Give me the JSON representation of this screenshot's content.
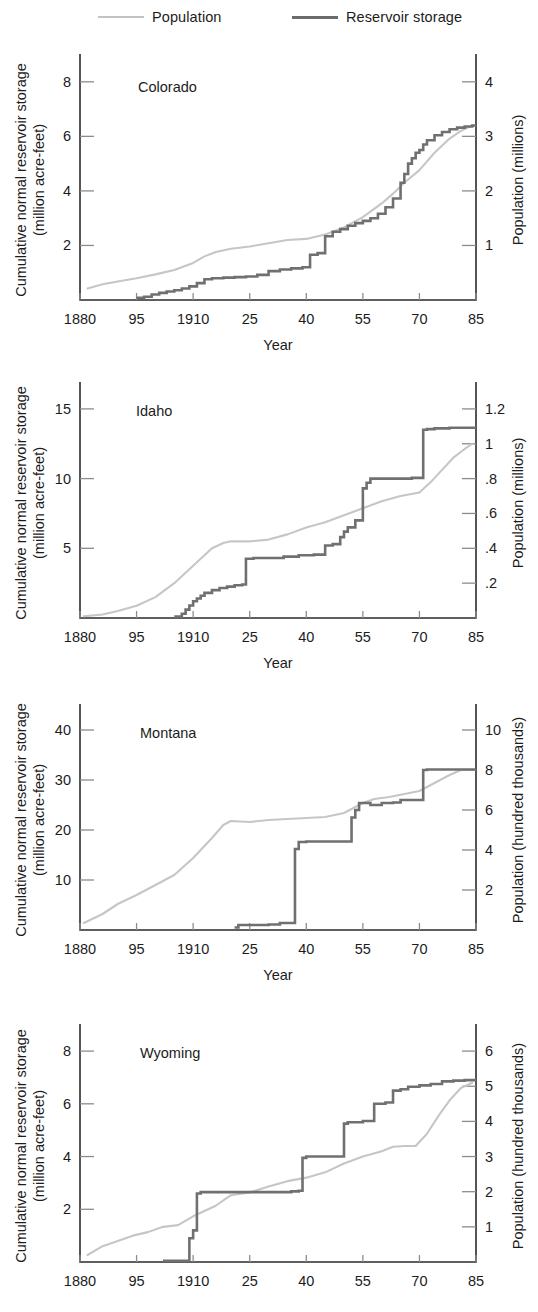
{
  "legend": {
    "items": [
      {
        "label": "Population",
        "color": "#c6c6c6",
        "style": "light-line"
      },
      {
        "label": "Reservoir storage",
        "color": "#707070",
        "style": "dark-line"
      }
    ]
  },
  "common": {
    "xlabel": "Year",
    "ylabel_left": "Cumulative normal reservoir storage",
    "ylabel_left_2": "(million acre-feet)",
    "x_tick_labels": [
      "1880",
      "95",
      "1910",
      "25",
      "40",
      "55",
      "70",
      "85"
    ],
    "x_tick_values": [
      1880,
      1895,
      1910,
      1925,
      1940,
      1955,
      1970,
      1985
    ],
    "xlim": [
      1880,
      1985
    ]
  },
  "chart_data": [
    {
      "type": "line",
      "title": "Colorado",
      "xlabel": "Year",
      "ylabel": "Cumulative normal reservoir storage (million acre-feet)",
      "ylabel_right": "Population (millions)",
      "xlim": [
        1880,
        1985
      ],
      "ylim": [
        0,
        8.8
      ],
      "ylim_right": [
        0,
        4.4
      ],
      "grid": false,
      "legend_position": "top",
      "yticks": [
        2,
        4,
        6,
        8
      ],
      "ytick_labels": [
        "2",
        "4",
        "6",
        "8"
      ],
      "yticks_right": [
        1,
        2,
        3,
        4
      ],
      "ytick_labels_right": [
        "1",
        "2",
        "3",
        "4"
      ],
      "series": [
        {
          "name": "Population",
          "axis": "right",
          "x": [
            1882,
            1886,
            1890,
            1895,
            1900,
            1905,
            1910,
            1913,
            1916,
            1920,
            1925,
            1930,
            1935,
            1940,
            1945,
            1950,
            1955,
            1960,
            1963,
            1966,
            1970,
            1974,
            1978,
            1981,
            1984
          ],
          "y": [
            0.21,
            0.29,
            0.34,
            0.4,
            0.47,
            0.55,
            0.68,
            0.8,
            0.88,
            0.94,
            0.98,
            1.04,
            1.1,
            1.12,
            1.2,
            1.33,
            1.52,
            1.77,
            1.95,
            2.15,
            2.38,
            2.7,
            2.96,
            3.1,
            3.2
          ]
        },
        {
          "name": "Reservoir storage",
          "axis": "left",
          "step": true,
          "x": [
            1895,
            1897,
            1899,
            1901,
            1903,
            1905,
            1907,
            1909,
            1911,
            1913,
            1915,
            1918,
            1921,
            1924,
            1927,
            1930,
            1933,
            1936,
            1939,
            1941,
            1943,
            1945,
            1947,
            1949,
            1951,
            1953,
            1955,
            1957,
            1959,
            1961,
            1963,
            1965,
            1966,
            1967,
            1968,
            1969,
            1970,
            1971,
            1972,
            1974,
            1976,
            1978,
            1980,
            1982,
            1984
          ],
          "y": [
            0.08,
            0.12,
            0.2,
            0.26,
            0.31,
            0.36,
            0.42,
            0.5,
            0.62,
            0.76,
            0.8,
            0.82,
            0.84,
            0.86,
            0.92,
            1.06,
            1.12,
            1.16,
            1.2,
            1.66,
            1.72,
            2.34,
            2.5,
            2.6,
            2.72,
            2.82,
            2.9,
            3.0,
            3.16,
            3.4,
            3.72,
            4.3,
            4.62,
            5.0,
            5.2,
            5.4,
            5.5,
            5.7,
            5.86,
            6.04,
            6.16,
            6.26,
            6.32,
            6.36,
            6.4
          ]
        }
      ]
    },
    {
      "type": "line",
      "title": "Idaho",
      "xlabel": "Year",
      "ylabel": "Cumulative normal reservoir storage (million acre-feet)",
      "ylabel_right": "Population (millions)",
      "xlim": [
        1880,
        1985
      ],
      "ylim": [
        0,
        16.5
      ],
      "ylim_right": [
        0,
        1.32
      ],
      "grid": false,
      "legend_position": "top",
      "yticks": [
        5,
        10,
        15
      ],
      "ytick_labels": [
        "5",
        "10",
        "15"
      ],
      "yticks_right": [
        0.2,
        0.4,
        0.6,
        0.8,
        1.0,
        1.2
      ],
      "ytick_labels_right": [
        ".2",
        ".4",
        ".6",
        ".8",
        "1",
        "1.2"
      ],
      "series": [
        {
          "name": "Population",
          "axis": "right",
          "x": [
            1881,
            1886,
            1890,
            1895,
            1900,
            1905,
            1910,
            1915,
            1918,
            1920,
            1925,
            1930,
            1935,
            1940,
            1945,
            1950,
            1955,
            1960,
            1965,
            1970,
            1973,
            1976,
            1979,
            1982,
            1984
          ],
          "y": [
            0.01,
            0.02,
            0.04,
            0.07,
            0.12,
            0.2,
            0.3,
            0.4,
            0.43,
            0.44,
            0.44,
            0.45,
            0.48,
            0.52,
            0.55,
            0.59,
            0.63,
            0.67,
            0.7,
            0.72,
            0.78,
            0.85,
            0.92,
            0.97,
            1.0
          ]
        },
        {
          "name": "Reservoir storage",
          "axis": "left",
          "step": true,
          "x": [
            1905,
            1907,
            1908,
            1909,
            1910,
            1911,
            1912,
            1913,
            1915,
            1917,
            1919,
            1921,
            1923,
            1924,
            1926,
            1930,
            1934,
            1938,
            1942,
            1945,
            1947,
            1949,
            1950,
            1951,
            1953,
            1955,
            1956,
            1957,
            1960,
            1964,
            1968,
            1971,
            1972,
            1974,
            1978,
            1982,
            1984
          ],
          "y": [
            0.1,
            0.3,
            0.6,
            0.9,
            1.2,
            1.4,
            1.6,
            1.8,
            2.0,
            2.15,
            2.25,
            2.35,
            2.4,
            4.25,
            4.3,
            4.3,
            4.4,
            4.5,
            4.55,
            5.2,
            5.3,
            5.8,
            6.2,
            6.5,
            7.0,
            9.3,
            9.7,
            10.0,
            10.0,
            10.0,
            10.05,
            13.5,
            13.55,
            13.6,
            13.65,
            13.65,
            13.65
          ]
        }
      ]
    },
    {
      "type": "line",
      "title": "Montana",
      "xlabel": "Year",
      "ylabel": "Cumulative normal reservoir storage (million acre-feet)",
      "ylabel_right": "Population (hundred thousands)",
      "xlim": [
        1880,
        1985
      ],
      "ylim": [
        0,
        44
      ],
      "ylim_right": [
        0,
        11
      ],
      "grid": false,
      "legend_position": "top",
      "yticks": [
        10,
        20,
        30,
        40
      ],
      "ytick_labels": [
        "10",
        "20",
        "30",
        "40"
      ],
      "yticks_right": [
        2,
        4,
        6,
        8,
        10
      ],
      "ytick_labels_right": [
        "2",
        "4",
        "6",
        "8",
        "10"
      ],
      "series": [
        {
          "name": "Population",
          "axis": "right",
          "x": [
            1881,
            1886,
            1890,
            1895,
            1900,
            1905,
            1910,
            1915,
            1918,
            1920,
            1925,
            1930,
            1935,
            1940,
            1945,
            1950,
            1955,
            1958,
            1962,
            1966,
            1970,
            1974,
            1978,
            1981,
            1984
          ],
          "y": [
            0.35,
            0.8,
            1.3,
            1.75,
            2.25,
            2.75,
            3.6,
            4.6,
            5.25,
            5.45,
            5.4,
            5.5,
            5.55,
            5.6,
            5.65,
            5.85,
            6.35,
            6.55,
            6.65,
            6.8,
            6.95,
            7.35,
            7.75,
            8.0,
            8.0
          ]
        },
        {
          "name": "Reservoir storage",
          "axis": "left",
          "step": true,
          "x": [
            1921,
            1922,
            1926,
            1930,
            1933,
            1936,
            1937,
            1938,
            1940,
            1943,
            1946,
            1950,
            1952,
            1953,
            1954,
            1955,
            1957,
            1960,
            1963,
            1965,
            1968,
            1971,
            1972,
            1975,
            1978,
            1981,
            1984
          ],
          "y": [
            0.5,
            1.0,
            1.0,
            1.1,
            1.4,
            1.4,
            16.2,
            17.6,
            17.7,
            17.7,
            17.7,
            17.7,
            22.5,
            24.0,
            25.4,
            25.4,
            25.0,
            25.4,
            25.5,
            26.0,
            26.0,
            32.0,
            32.1,
            32.1,
            32.1,
            32.1,
            32.1
          ]
        }
      ]
    },
    {
      "type": "line",
      "title": "Wyoming",
      "xlabel": "Year",
      "ylabel": "Cumulative normal reservoir storage (million acre-feet)",
      "ylabel_right": "Population (hundred thousands)",
      "xlim": [
        1880,
        1985
      ],
      "ylim": [
        0,
        8.8
      ],
      "ylim_right": [
        0,
        6.6
      ],
      "grid": false,
      "legend_position": "top",
      "yticks": [
        2,
        4,
        6,
        8
      ],
      "ytick_labels": [
        "2",
        "4",
        "6",
        "8"
      ],
      "yticks_right": [
        1,
        2,
        3,
        4,
        5,
        6
      ],
      "ytick_labels_right": [
        "1",
        "2",
        "3",
        "4",
        "5",
        "6"
      ],
      "series": [
        {
          "name": "Population",
          "axis": "right",
          "x": [
            1882,
            1886,
            1890,
            1894,
            1898,
            1902,
            1906,
            1910,
            1913,
            1916,
            1920,
            1925,
            1930,
            1935,
            1940,
            1945,
            1950,
            1955,
            1960,
            1963,
            1966,
            1969,
            1972,
            1975,
            1978,
            1981,
            1984
          ],
          "y": [
            0.2,
            0.45,
            0.6,
            0.75,
            0.85,
            1.0,
            1.05,
            1.3,
            1.45,
            1.6,
            1.9,
            1.98,
            2.15,
            2.3,
            2.4,
            2.55,
            2.8,
            3.0,
            3.15,
            3.28,
            3.3,
            3.3,
            3.65,
            4.15,
            4.6,
            4.95,
            5.1
          ]
        },
        {
          "name": "Reservoir storage",
          "axis": "left",
          "step": true,
          "x": [
            1902,
            1908,
            1909,
            1910,
            1911,
            1912,
            1914,
            1920,
            1926,
            1932,
            1936,
            1938,
            1939,
            1940,
            1941,
            1944,
            1947,
            1950,
            1951,
            1955,
            1958,
            1961,
            1963,
            1965,
            1967,
            1970,
            1973,
            1976,
            1979,
            1982,
            1984
          ],
          "y": [
            0.05,
            0.05,
            0.9,
            1.2,
            2.6,
            2.65,
            2.65,
            2.65,
            2.65,
            2.65,
            2.68,
            2.7,
            3.95,
            4.0,
            4.0,
            4.0,
            4.0,
            5.25,
            5.3,
            5.35,
            6.0,
            6.05,
            6.5,
            6.55,
            6.65,
            6.7,
            6.75,
            6.85,
            6.88,
            6.9,
            6.9
          ]
        }
      ]
    }
  ]
}
